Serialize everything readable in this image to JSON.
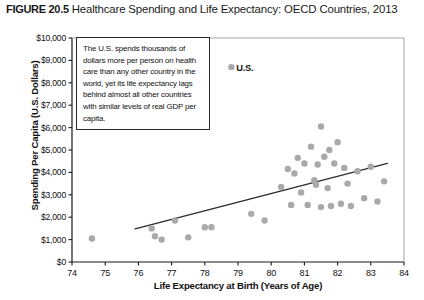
{
  "figure": {
    "number": "FIGURE 20.5",
    "title": "Healthcare Spending and Life Expectancy: OECD Countries, 2013"
  },
  "annotation": {
    "text": "The U.S. spends thousands of dollars more per person on health care than any other country in the world, yet its life expectancy lags behind almost all other countries with similar levels  of real GDP per capita."
  },
  "highlight": {
    "label": "U.S."
  },
  "colors": {
    "point_fill": "#a9a9a9",
    "axis": "#1a1a1a",
    "trendline": "#2b2b2b",
    "text": "#111111",
    "background": "#ffffff"
  },
  "chart_data": {
    "type": "scatter",
    "title": "Healthcare Spending and Life Expectancy: OECD Countries, 2013",
    "xlabel": "Life Expectancy at Birth (Years of Age)",
    "ylabel": "Spending Per Capita (U.S. Dollars)",
    "xlim": [
      74,
      84
    ],
    "ylim": [
      0,
      10000
    ],
    "xticks": [
      74,
      75,
      76,
      77,
      78,
      79,
      80,
      81,
      82,
      83,
      84
    ],
    "xtick_labels": [
      "74",
      "75",
      "76",
      "77",
      "78",
      "79",
      "80",
      "81",
      "82",
      "83",
      "84"
    ],
    "yticks": [
      0,
      1000,
      2000,
      3000,
      4000,
      5000,
      6000,
      7000,
      8000,
      9000,
      10000
    ],
    "ytick_labels": [
      "$0",
      "$1,000",
      "$2,000",
      "$3,000",
      "$4,000",
      "$5,000",
      "$6,000",
      "$7,000",
      "$8,000",
      "$9,000",
      "$10,000"
    ],
    "grid": false,
    "legend": false,
    "points": [
      {
        "x": 74.6,
        "y": 1050
      },
      {
        "x": 76.4,
        "y": 1500
      },
      {
        "x": 76.5,
        "y": 1150
      },
      {
        "x": 76.7,
        "y": 1000
      },
      {
        "x": 77.1,
        "y": 1850
      },
      {
        "x": 77.5,
        "y": 1100
      },
      {
        "x": 78.0,
        "y": 1550
      },
      {
        "x": 78.2,
        "y": 1550
      },
      {
        "x": 78.8,
        "y": 8700,
        "label": "U.S."
      },
      {
        "x": 79.4,
        "y": 2150
      },
      {
        "x": 79.8,
        "y": 1850
      },
      {
        "x": 80.3,
        "y": 3350
      },
      {
        "x": 80.5,
        "y": 4150
      },
      {
        "x": 80.6,
        "y": 2550
      },
      {
        "x": 80.7,
        "y": 3950
      },
      {
        "x": 80.8,
        "y": 4650
      },
      {
        "x": 80.9,
        "y": 3100
      },
      {
        "x": 81.0,
        "y": 4400
      },
      {
        "x": 81.1,
        "y": 2550
      },
      {
        "x": 81.2,
        "y": 5150
      },
      {
        "x": 81.3,
        "y": 3650
      },
      {
        "x": 81.35,
        "y": 3450
      },
      {
        "x": 81.4,
        "y": 4350
      },
      {
        "x": 81.5,
        "y": 6050
      },
      {
        "x": 81.5,
        "y": 2450
      },
      {
        "x": 81.6,
        "y": 4700
      },
      {
        "x": 81.7,
        "y": 3300
      },
      {
        "x": 81.75,
        "y": 5000
      },
      {
        "x": 81.8,
        "y": 2500
      },
      {
        "x": 81.9,
        "y": 4400
      },
      {
        "x": 82.0,
        "y": 5350
      },
      {
        "x": 82.1,
        "y": 2600
      },
      {
        "x": 82.2,
        "y": 4200
      },
      {
        "x": 82.3,
        "y": 3500
      },
      {
        "x": 82.4,
        "y": 2500
      },
      {
        "x": 82.6,
        "y": 4050
      },
      {
        "x": 82.8,
        "y": 2850
      },
      {
        "x": 83.0,
        "y": 4250
      },
      {
        "x": 83.2,
        "y": 2700
      },
      {
        "x": 83.4,
        "y": 3600
      }
    ],
    "trendline": {
      "x0": 75.9,
      "y0": 1480,
      "x1": 83.5,
      "y1": 4400
    }
  }
}
